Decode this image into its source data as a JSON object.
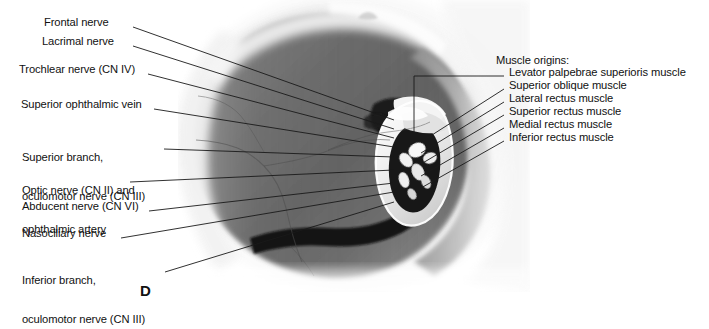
{
  "figure": {
    "panel_letter": "D",
    "caption_note": "orbital apex photograph"
  },
  "left_labels": [
    {
      "id": "frontal-nerve",
      "lines": [
        "Frontal nerve"
      ],
      "x": 44,
      "y": 22,
      "leader_from": [
        133,
        27
      ],
      "leader_to": [
        392,
        120
      ]
    },
    {
      "id": "lacrimal-nerve",
      "lines": [
        "Lacrimal nerve"
      ],
      "x": 42,
      "y": 41,
      "leader_from": [
        133,
        46
      ],
      "leader_to": [
        392,
        128
      ]
    },
    {
      "id": "trochlear-nerve",
      "lines": [
        "Trochlear nerve (CN IV)"
      ],
      "x": 19,
      "y": 69,
      "leader_from": [
        146,
        74
      ],
      "leader_to": [
        392,
        136
      ]
    },
    {
      "id": "superior-ophthalmic-vein",
      "lines": [
        "Superior ophthalmic vein"
      ],
      "x": 21,
      "y": 104,
      "leader_from": [
        152,
        109
      ],
      "leader_to": [
        392,
        145
      ]
    },
    {
      "id": "superior-branch-oculomotor",
      "lines": [
        "Superior branch,",
        "oculomotor nerve (CN III)"
      ],
      "x": 22,
      "y": 131,
      "leader_from": [
        162,
        149
      ],
      "leader_to": [
        392,
        155
      ]
    },
    {
      "id": "optic-nerve-ophthalmic-artery",
      "lines": [
        "Optic nerve (CN II) and",
        "ophthalmic artery"
      ],
      "x": 22,
      "y": 164,
      "leader_from": [
        128,
        182
      ],
      "leader_to": [
        392,
        168
      ]
    },
    {
      "id": "abducent-nerve",
      "lines": [
        "Abducent nerve (CN VI)"
      ],
      "x": 22,
      "y": 206,
      "leader_from": [
        147,
        211
      ],
      "leader_to": [
        392,
        180
      ]
    },
    {
      "id": "nasociliary-nerve",
      "lines": [
        "Nasociliary nerve"
      ],
      "x": 22,
      "y": 233,
      "leader_from": [
        119,
        238
      ],
      "leader_to": [
        392,
        188
      ]
    },
    {
      "id": "inferior-branch-oculomotor",
      "lines": [
        "Inferior branch,",
        "oculomotor nerve (CN III)"
      ],
      "x": 22,
      "y": 254,
      "leader_from": [
        163,
        272
      ],
      "leader_to": [
        392,
        198
      ]
    }
  ],
  "right_heading": {
    "id": "muscle-origins-heading",
    "text": "Muscle origins:",
    "x": 496,
    "y": 60
  },
  "right_labels": [
    {
      "id": "levator-palpebrae-superioris-muscle",
      "text": "Levator palpebrae superioris muscle",
      "x": 509,
      "y": 72,
      "leader_from": [
        506,
        77
      ],
      "leader_to": [
        412,
        132
      ],
      "elbow": [
        412,
        98
      ]
    },
    {
      "id": "superior-oblique-muscle",
      "text": "Superior oblique muscle",
      "x": 509,
      "y": 85,
      "leader_from": [
        506,
        90
      ],
      "leader_to": [
        420,
        141
      ]
    },
    {
      "id": "lateral-rectus-muscle",
      "text": "Lateral rectus muscle",
      "x": 509,
      "y": 98,
      "leader_from": [
        506,
        103
      ],
      "leader_to": [
        420,
        152
      ]
    },
    {
      "id": "superior-rectus-muscle",
      "text": "Superior rectus muscle",
      "x": 509,
      "y": 111,
      "leader_from": [
        506,
        116
      ],
      "leader_to": [
        420,
        163
      ]
    },
    {
      "id": "medial-rectus-muscle",
      "text": "Medial rectus muscle",
      "x": 509,
      "y": 124,
      "leader_from": [
        506,
        129
      ],
      "leader_to": [
        420,
        174
      ]
    },
    {
      "id": "inferior-rectus-muscle",
      "text": "Inferior rectus muscle",
      "x": 509,
      "y": 137,
      "leader_from": [
        506,
        142
      ],
      "leader_to": [
        420,
        186
      ]
    }
  ],
  "colors": {
    "text": "#111111",
    "leader": "#1a1a1a",
    "background": "#ffffff"
  }
}
